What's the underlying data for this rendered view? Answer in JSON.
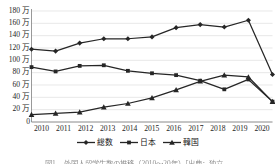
{
  "figure": {
    "caption": "図1　 外国人留学生数の推移（2010～20年）［出典：独立…",
    "background_color": "#ffffff"
  },
  "axes": {
    "y_tick_labels": [
      "180 万",
      "160 万",
      "140 万",
      "120 万",
      "100 万",
      "80 万",
      "60 万",
      "40 万",
      "20 万",
      "0"
    ],
    "x_tick_labels": [
      "2010",
      "2011",
      "2012",
      "2013",
      "2014",
      "2015",
      "2016",
      "2017",
      "2018",
      "2019",
      "2020"
    ],
    "grid": "horizontal",
    "grid_color": "#d9d9d9",
    "axis_color": "#7f7f7f"
  },
  "legend": {
    "position": "bottom-center",
    "items": [
      {
        "label": "総数",
        "marker": "diamond",
        "color": "#262626"
      },
      {
        "label": "日本",
        "marker": "square",
        "color": "#262626"
      },
      {
        "label": "韓国",
        "marker": "triangle",
        "color": "#262626"
      }
    ]
  },
  "chart_data": {
    "type": "line",
    "title": "",
    "xlabel": "",
    "ylabel": "",
    "unit": "万",
    "x": [
      "2010",
      "2011",
      "2012",
      "2013",
      "2014",
      "2015",
      "2016",
      "2017",
      "2018",
      "2019",
      "2020"
    ],
    "ylim": [
      0,
      180
    ],
    "ytick_values": [
      0,
      20,
      40,
      60,
      80,
      100,
      120,
      140,
      160,
      180
    ],
    "grid": true,
    "legend_position": "bottom",
    "series": [
      {
        "name": "総数",
        "marker": "diamond",
        "color": "#262626",
        "values": [
          118,
          115,
          128,
          135,
          135,
          138,
          153,
          158,
          154,
          165,
          77
        ]
      },
      {
        "name": "日本",
        "marker": "square",
        "color": "#262626",
        "values": [
          89,
          82,
          91,
          92,
          83,
          79,
          76,
          67,
          53,
          69,
          33
        ]
      },
      {
        "name": "韓国",
        "marker": "triangle",
        "color": "#262626",
        "values": [
          12,
          14,
          16,
          24,
          30,
          39,
          52,
          66,
          76,
          73,
          33
        ]
      }
    ]
  }
}
